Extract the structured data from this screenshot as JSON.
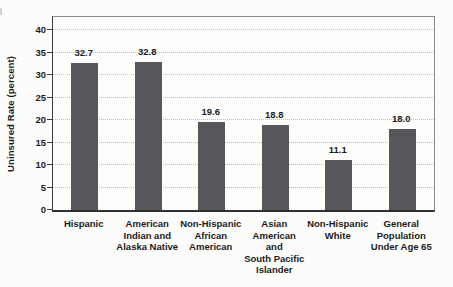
{
  "figure": {
    "background": "#fcfcfb"
  },
  "chart_data": {
    "type": "bar",
    "title": "",
    "xlabel": "",
    "ylabel": "Uninsured Rate (percent)",
    "categories": [
      "Hispanic",
      "American Indian and Alaska Native",
      "Non-Hispanic African American",
      "Asian American and South Pacific Islander",
      "Non-Hispanic White",
      "General Population Under Age 65"
    ],
    "category_label_lines": [
      "Hispanic",
      "American\nIndian and\nAlaska Native",
      "Non-Hispanic\nAfrican\nAmerican",
      "Asian\nAmerican\nand\nSouth Pacific\nIslander",
      "Non-Hispanic\nWhite",
      "General\nPopulation\nUnder Age 65"
    ],
    "values": [
      32.7,
      32.8,
      19.6,
      18.8,
      11.1,
      18.0
    ],
    "value_labels": [
      "32.7",
      "32.8",
      "19.6",
      "18.8",
      "11.1",
      "18.0"
    ],
    "ylim": [
      0,
      40
    ],
    "yticks": [
      0,
      5,
      10,
      15,
      20,
      25,
      30,
      35,
      40
    ],
    "grid": "horizontal-dotted",
    "legend": "none",
    "bar_color": "#56575a",
    "gridline_color": "#bdbdbd",
    "axis_color": "#3c3c3c",
    "text_color": "#1b1b1b"
  }
}
